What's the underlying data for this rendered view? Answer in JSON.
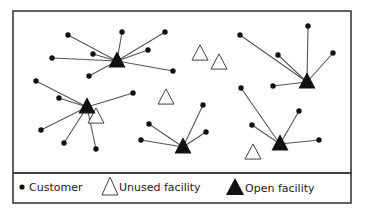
{
  "diagram": {
    "colors": {
      "frame": "#3a3a3a",
      "edge": "#555555",
      "customer": "#111111",
      "open_facility": "#111111",
      "unused_fill": "#ffffff",
      "unused_stroke": "#444444"
    },
    "frame": {
      "x": 13,
      "y": 11,
      "w": 338,
      "h": 162
    },
    "legend_box": {
      "x": 13,
      "y": 173,
      "w": 338,
      "h": 30
    },
    "clusters": [
      {
        "facility": [
          117,
          61
        ],
        "customers": [
          [
            68,
            35
          ],
          [
            122,
            32
          ],
          [
            165,
            32
          ],
          [
            93,
            54
          ],
          [
            148,
            50
          ],
          [
            52,
            58
          ],
          [
            173,
            71
          ],
          [
            89,
            76
          ]
        ]
      },
      {
        "facility": [
          87,
          107
        ],
        "customers": [
          [
            36,
            81
          ],
          [
            59,
            98
          ],
          [
            133,
            93
          ],
          [
            41,
            130
          ],
          [
            64,
            143
          ],
          [
            96,
            149
          ]
        ]
      },
      {
        "facility": [
          183,
          147
        ],
        "customers": [
          [
            203,
            105
          ],
          [
            149,
            124
          ],
          [
            206,
            132
          ],
          [
            141,
            140
          ]
        ]
      },
      {
        "facility": [
          307,
          82
        ],
        "customers": [
          [
            308,
            26
          ],
          [
            240,
            35
          ],
          [
            278,
            55
          ],
          [
            333,
            53
          ],
          [
            273,
            86
          ]
        ]
      },
      {
        "facility": [
          280,
          144
        ],
        "customers": [
          [
            241,
            88
          ],
          [
            299,
            111
          ],
          [
            252,
            125
          ],
          [
            319,
            140
          ]
        ]
      }
    ],
    "unused_facilities": [
      [
        200,
        54
      ],
      [
        219,
        63
      ],
      [
        96,
        117
      ],
      [
        166,
        98
      ],
      [
        253,
        153
      ]
    ]
  },
  "legend": {
    "items": [
      {
        "symbol": "customer-dot",
        "label": "Customer"
      },
      {
        "symbol": "unused-facility-triangle",
        "label": "Unused facility"
      },
      {
        "symbol": "open-facility-triangle",
        "label": "Open facility"
      }
    ]
  }
}
